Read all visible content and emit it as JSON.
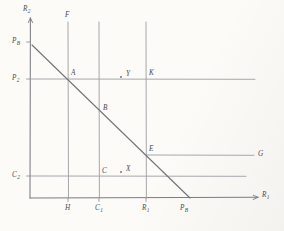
{
  "figure": {
    "kind": "hand-drawn-economics-graph",
    "paper_color": "#fcfbf8",
    "ink_color": "#8d8d93",
    "ink_color_dark": "#5f5f66"
  },
  "axes": {
    "y_label": "R",
    "y_label_sub": "2",
    "x_label": "R",
    "x_label_sub": "1",
    "origin": {
      "x": 30,
      "y": 198
    },
    "x_end": 258,
    "y_top": 18
  },
  "y_ticks": [
    {
      "id": "pb",
      "label": "P",
      "sub": "B",
      "y": 42
    },
    {
      "id": "p2",
      "label": "P",
      "sub": "2",
      "y": 79
    },
    {
      "id": "c2",
      "label": "C",
      "sub": "2",
      "y": 176
    }
  ],
  "x_ticks": [
    {
      "id": "h",
      "label": "H",
      "sub": "",
      "x": 68
    },
    {
      "id": "c1",
      "label": "C",
      "sub": "1",
      "x": 99
    },
    {
      "id": "r1",
      "label": "R",
      "sub": "1",
      "x": 146
    },
    {
      "id": "pb",
      "label": "P",
      "sub": "B",
      "x": 182
    }
  ],
  "vertical_lines": [
    {
      "id": "line-f",
      "x": 68,
      "y_top": 22,
      "y_bottom": 198,
      "top_label": "F"
    },
    {
      "id": "line-c1",
      "x": 99,
      "y_top": 22,
      "y_bottom": 198,
      "top_label": ""
    },
    {
      "id": "line-r1",
      "x": 146,
      "y_top": 22,
      "y_bottom": 198,
      "top_label": ""
    }
  ],
  "horizontal_lines": [
    {
      "id": "line-p2",
      "y": 79,
      "x_start": 30,
      "x_end": 255,
      "end_label": ""
    },
    {
      "id": "line-g",
      "y": 155,
      "x_start": 146,
      "x_end": 254,
      "end_label": "G"
    },
    {
      "id": "line-c2",
      "y": 176,
      "x_start": 30,
      "x_end": 246,
      "end_label": ""
    }
  ],
  "budget_line": {
    "id": "budget-line",
    "from": {
      "x": 32,
      "y": 45
    },
    "to": {
      "x": 190,
      "y": 198
    },
    "start_label": "P",
    "start_sub": "B",
    "end_label": "P",
    "end_sub": "B"
  },
  "points": [
    {
      "id": "A",
      "label": "A",
      "x": 68,
      "y": 79,
      "lx": 71,
      "ly": 70,
      "marker": false
    },
    {
      "id": "B",
      "label": "B",
      "x": 99,
      "y": 113,
      "lx": 103,
      "ly": 105,
      "marker": false
    },
    {
      "id": "C",
      "label": "C",
      "x": 99,
      "y": 176,
      "lx": 102,
      "ly": 168,
      "marker": false
    },
    {
      "id": "E",
      "label": "E",
      "x": 146,
      "y": 155,
      "lx": 149,
      "ly": 146,
      "marker": false
    },
    {
      "id": "K",
      "label": "K",
      "x": 146,
      "y": 79,
      "lx": 149,
      "ly": 70,
      "marker": false
    },
    {
      "id": "Y",
      "label": "Y",
      "x": 121,
      "y": 77,
      "lx": 126,
      "ly": 71,
      "marker": true
    },
    {
      "id": "X",
      "label": "X",
      "x": 121,
      "y": 172,
      "lx": 126,
      "ly": 166,
      "marker": true
    }
  ]
}
